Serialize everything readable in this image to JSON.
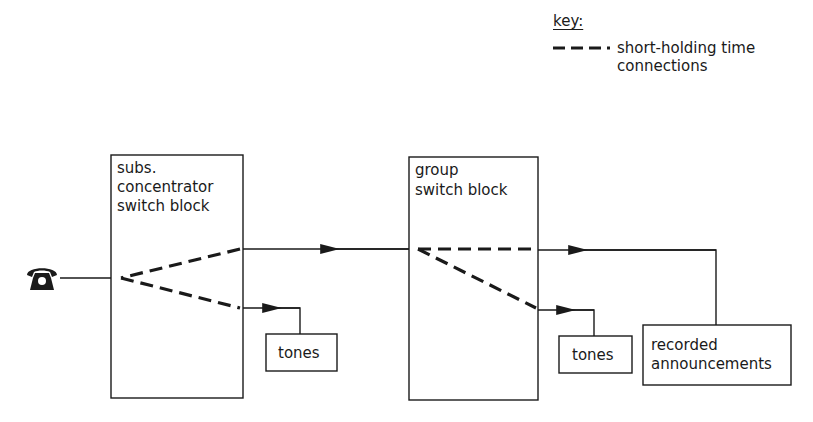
{
  "key": {
    "title": "key:",
    "entries": [
      {
        "style": "dashed",
        "label_line1": "short-holding time",
        "label_line2": "connections"
      }
    ]
  },
  "nodes": {
    "telephone": {
      "icon": "telephone-icon"
    },
    "subs_block": {
      "line1": "subs.",
      "line2": "concentrator",
      "line3": "switch block"
    },
    "group_block": {
      "line1": "group",
      "line2": "switch block"
    },
    "tones_left": {
      "label": "tones"
    },
    "tones_right": {
      "label": "tones"
    },
    "recorded": {
      "line1": "recorded",
      "line2": "announcements"
    }
  },
  "edges": [
    {
      "from": "telephone",
      "to": "subs_block",
      "style": "solid"
    },
    {
      "from": "group_block",
      "to": "subs_block",
      "style": "solid",
      "arrow": true
    },
    {
      "from": "tones_left",
      "to": "subs_block",
      "style": "solid",
      "arrow": true
    },
    {
      "from": "recorded",
      "to": "group_block",
      "style": "solid",
      "arrow": true
    },
    {
      "from": "tones_right",
      "to": "group_block",
      "style": "solid",
      "arrow": true
    },
    {
      "within": "subs_block",
      "style": "dashed",
      "note": "short-holding time connections"
    },
    {
      "within": "group_block",
      "style": "dashed",
      "note": "short-holding time connections"
    }
  ]
}
